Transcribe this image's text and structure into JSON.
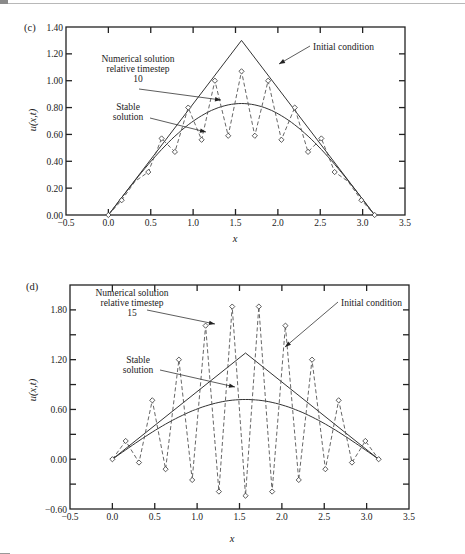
{
  "chart_data": [
    {
      "panel": "(c)",
      "type": "line",
      "xlabel": "x",
      "ylabel": "u(x,t)",
      "xlim": [
        -0.5,
        3.5
      ],
      "ylim": [
        0.0,
        1.4
      ],
      "xticks": [
        -0.5,
        0.0,
        0.5,
        1.0,
        1.5,
        2.0,
        2.5,
        3.0,
        3.5
      ],
      "xtick_labels": [
        "−0.5",
        "0.0",
        "0.5",
        "1.0",
        "1.5",
        "2.0",
        "2.5",
        "3.0",
        "3.5"
      ],
      "yticks": [
        0.0,
        0.2,
        0.4,
        0.6,
        0.8,
        1.0,
        1.2,
        1.4
      ],
      "ytick_labels": [
        "0.00",
        "0.20",
        "0.40",
        "0.60",
        "0.80",
        "1.00",
        "1.20",
        "1.40"
      ],
      "series": [
        {
          "name": "Initial condition",
          "style": "solid",
          "x": [
            0.0,
            1.5708,
            3.1416
          ],
          "y": [
            0.0,
            1.3,
            0.0
          ]
        },
        {
          "name": "Stable solution",
          "style": "solid",
          "function": "0.83*sin(x)",
          "peak": 0.83
        },
        {
          "name": "Numerical solution relative timestep 10",
          "style": "dashed",
          "marker": "diamond",
          "x": [
            0.0,
            0.157,
            0.314,
            0.471,
            0.628,
            0.785,
            0.942,
            1.1,
            1.257,
            1.414,
            1.571,
            1.728,
            1.885,
            2.042,
            2.199,
            2.356,
            2.513,
            2.67,
            2.827,
            2.985,
            3.142
          ],
          "y": [
            0.0,
            0.11,
            0.25,
            0.32,
            0.57,
            0.47,
            0.8,
            0.56,
            1.0,
            0.59,
            1.07,
            0.59,
            1.0,
            0.56,
            0.8,
            0.47,
            0.57,
            0.32,
            0.25,
            0.11,
            0.0
          ],
          "marked": [
            true,
            true,
            false,
            true,
            true,
            true,
            true,
            true,
            true,
            true,
            true,
            true,
            true,
            true,
            true,
            true,
            true,
            true,
            false,
            true,
            true
          ]
        }
      ],
      "annotations": [
        {
          "text_lines": [
            "Numerical solution",
            "relative timestep",
            "10"
          ],
          "target": "Numerical solution relative timestep 10"
        },
        {
          "text_lines": [
            "Stable",
            "solution"
          ],
          "target": "Stable solution"
        },
        {
          "text_lines": [
            "Initial condition"
          ],
          "target": "Initial condition"
        }
      ]
    },
    {
      "panel": "(d)",
      "type": "line",
      "xlabel": "x",
      "ylabel": "u(x,t)",
      "xlim": [
        -0.5,
        3.5
      ],
      "ylim": [
        -0.6,
        2.1
      ],
      "xticks": [
        -0.5,
        0.0,
        0.5,
        1.0,
        1.5,
        2.0,
        2.5,
        3.0,
        3.5
      ],
      "xtick_labels": [
        "−0.5",
        "0.0",
        "0.5",
        "1.0",
        "1.5",
        "2.0",
        "2.5",
        "3.0",
        "3.5"
      ],
      "yticks": [
        -0.6,
        -0.3,
        0.0,
        0.3,
        0.6,
        0.9,
        1.2,
        1.5,
        1.8
      ],
      "ytick_labels": [
        "−0.60",
        "",
        "0.00",
        "",
        "0.60",
        "",
        "1.20",
        "",
        "1.80"
      ],
      "series": [
        {
          "name": "Initial condition",
          "style": "solid",
          "x": [
            0.0,
            1.5708,
            3.1416
          ],
          "y": [
            0.0,
            1.28,
            0.0
          ]
        },
        {
          "name": "Stable solution",
          "style": "solid",
          "function": "0.72*sin(x)",
          "peak": 0.72
        },
        {
          "name": "Numerical solution relative timestep 15",
          "style": "dashed",
          "marker": "diamond",
          "x": [
            0.0,
            0.157,
            0.314,
            0.471,
            0.628,
            0.785,
            0.942,
            1.1,
            1.257,
            1.414,
            1.571,
            1.728,
            1.885,
            2.042,
            2.199,
            2.356,
            2.513,
            2.67,
            2.827,
            2.985,
            3.142
          ],
          "y": [
            0.0,
            0.22,
            -0.04,
            0.71,
            -0.12,
            1.2,
            -0.25,
            1.61,
            -0.39,
            1.84,
            -0.44,
            1.84,
            -0.39,
            1.61,
            -0.25,
            1.2,
            -0.12,
            0.71,
            -0.04,
            0.22,
            0.0
          ]
        }
      ],
      "annotations": [
        {
          "text_lines": [
            "Numerical solution",
            "relative timestep",
            "15"
          ],
          "target": "Numerical solution relative timestep 15"
        },
        {
          "text_lines": [
            "Stable",
            "solution"
          ],
          "target": "Stable solution"
        },
        {
          "text_lines": [
            "Initial condition"
          ],
          "target": "Initial condition"
        }
      ]
    }
  ]
}
